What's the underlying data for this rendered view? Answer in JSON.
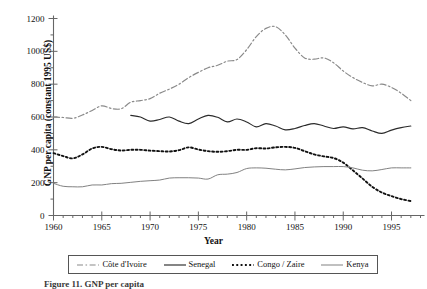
{
  "chart_data": {
    "type": "line",
    "title": "",
    "xlabel": "Year",
    "ylabel": "GNP per capita (constant 1995 US$)",
    "xlim": [
      1960,
      1998
    ],
    "ylim": [
      0,
      1200
    ],
    "ytick_values": [
      0,
      200,
      400,
      600,
      800,
      1000,
      1200
    ],
    "ytick_labels": [
      "0",
      "200",
      "400",
      "600",
      "800",
      "1000",
      "1200"
    ],
    "xtick_values": [
      1960,
      1965,
      1970,
      1975,
      1980,
      1985,
      1990,
      1995
    ],
    "xtick_labels": [
      "1960",
      "1965",
      "1970",
      "1975",
      "1980",
      "1985",
      "1990",
      "1995"
    ],
    "xtick_minor_step": 1,
    "ytick_minor_step": 100,
    "grid": false,
    "legend_position": "below-axes",
    "series": [
      {
        "name": "Côte d'Ivoire",
        "linestyle": "dashdot",
        "color": "#8a8a8a",
        "x": [
          1960,
          1961,
          1962,
          1963,
          1964,
          1965,
          1966,
          1967,
          1968,
          1969,
          1970,
          1971,
          1972,
          1973,
          1974,
          1975,
          1976,
          1977,
          1978,
          1979,
          1980,
          1981,
          1982,
          1983,
          1984,
          1985,
          1986,
          1987,
          1988,
          1989,
          1990,
          1991,
          1992,
          1993,
          1994,
          1995,
          1996,
          1997
        ],
        "values": [
          600,
          597,
          592,
          612,
          640,
          668,
          652,
          650,
          690,
          700,
          712,
          745,
          770,
          800,
          840,
          872,
          900,
          915,
          940,
          950,
          1010,
          1090,
          1140,
          1150,
          1100,
          1020,
          960,
          952,
          960,
          930,
          880,
          840,
          810,
          790,
          800,
          780,
          745,
          700
        ]
      },
      {
        "name": "Senegal",
        "linestyle": "solid",
        "color": "#2b2b2b",
        "x": [
          1968,
          1969,
          1970,
          1971,
          1972,
          1973,
          1974,
          1975,
          1976,
          1977,
          1978,
          1979,
          1980,
          1981,
          1982,
          1983,
          1984,
          1985,
          1986,
          1987,
          1988,
          1989,
          1990,
          1991,
          1992,
          1993,
          1994,
          1995,
          1996,
          1997
        ],
        "values": [
          610,
          600,
          575,
          585,
          600,
          575,
          560,
          588,
          610,
          598,
          570,
          588,
          570,
          540,
          560,
          545,
          522,
          530,
          548,
          560,
          545,
          530,
          540,
          528,
          535,
          515,
          500,
          520,
          535,
          545
        ]
      },
      {
        "name": "Congo / Zaire",
        "linestyle": "dotted",
        "color": "#111111",
        "x": [
          1960,
          1961,
          1962,
          1963,
          1964,
          1965,
          1966,
          1967,
          1968,
          1969,
          1970,
          1971,
          1972,
          1973,
          1974,
          1975,
          1976,
          1977,
          1978,
          1979,
          1980,
          1981,
          1982,
          1983,
          1984,
          1985,
          1986,
          1987,
          1988,
          1989,
          1990,
          1991,
          1992,
          1993,
          1994,
          1995,
          1996,
          1997
        ],
        "values": [
          380,
          362,
          348,
          372,
          408,
          418,
          404,
          396,
          400,
          400,
          395,
          392,
          390,
          398,
          415,
          402,
          392,
          388,
          392,
          400,
          400,
          410,
          408,
          415,
          418,
          412,
          392,
          372,
          360,
          350,
          322,
          275,
          225,
          175,
          140,
          118,
          100,
          88
        ]
      },
      {
        "name": "Kenya",
        "linestyle": "solid-thin",
        "color": "#7a7a7a",
        "x": [
          1960,
          1961,
          1962,
          1963,
          1964,
          1965,
          1966,
          1967,
          1968,
          1969,
          1970,
          1971,
          1972,
          1973,
          1974,
          1975,
          1976,
          1977,
          1978,
          1979,
          1980,
          1981,
          1982,
          1983,
          1984,
          1985,
          1986,
          1987,
          1988,
          1989,
          1990,
          1991,
          1992,
          1993,
          1994,
          1995,
          1996,
          1997
        ],
        "values": [
          196,
          178,
          175,
          175,
          186,
          186,
          194,
          196,
          202,
          208,
          212,
          216,
          228,
          230,
          230,
          228,
          222,
          248,
          252,
          262,
          286,
          290,
          288,
          282,
          278,
          284,
          292,
          296,
          298,
          298,
          298,
          290,
          276,
          272,
          280,
          290,
          290,
          290
        ]
      }
    ]
  },
  "axis": {
    "y_title": "GNP per capita (constant 1995 US$)",
    "x_title": "Year"
  },
  "legend": {
    "entries": [
      {
        "label": "Côte d'Ivoire",
        "style": "dashdot"
      },
      {
        "label": "Senegal",
        "style": "solid"
      },
      {
        "label": "Congo / Zaire",
        "style": "dotted"
      },
      {
        "label": "Kenya",
        "style": "solid-thin"
      }
    ]
  },
  "caption": {
    "text": "Figure 11. GNP per capita"
  },
  "title": {
    "text": ""
  },
  "colors": {
    "cote_divoire": "#8a8a8a",
    "senegal": "#2b2b2b",
    "congo_zaire": "#111111",
    "kenya": "#7a7a7a",
    "axis": "#666666"
  }
}
